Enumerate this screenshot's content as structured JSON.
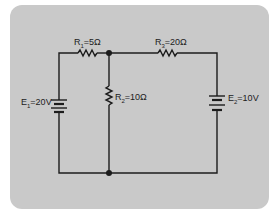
{
  "diagram": {
    "type": "circuit-schematic",
    "background_color": "#c9c9c9",
    "line_color": "#1c1c1c",
    "components": {
      "R1": {
        "symbol": "R",
        "sub": "1",
        "value": "=5Ω"
      },
      "R2": {
        "symbol": "R",
        "sub": "2",
        "value": "=10Ω"
      },
      "R3": {
        "symbol": "R",
        "sub": "3",
        "value": "=20Ω"
      },
      "E1": {
        "symbol": "E",
        "sub": "1",
        "value": "=20V"
      },
      "E2": {
        "symbol": "E",
        "sub": "2",
        "value": "=10V"
      }
    },
    "nodes": [
      "top-junction",
      "bottom-junction"
    ]
  }
}
